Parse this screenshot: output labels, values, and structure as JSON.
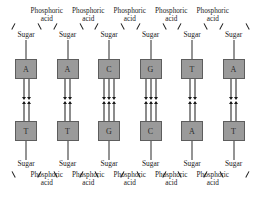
{
  "diagram": {
    "colors": {
      "base_fill": "#9a9a9a",
      "base_border": "#5d5d5d",
      "line": "#1a1a1a",
      "background": "#ffffff"
    },
    "labels": {
      "sugar": "Sugar",
      "phosphoric_line1": "Phosphoric",
      "phosphoric_line2": "acid"
    },
    "top_strand": {
      "bases": [
        "A",
        "A",
        "C",
        "G",
        "T",
        "A"
      ],
      "sugar_labels": [
        "Sugar",
        "Sugar",
        "Sugar",
        "Sugar",
        "Sugar",
        "Sugar"
      ],
      "phosphoric_labels": [
        {
          "line1": "Phosphoric",
          "line2": "acid"
        },
        {
          "line1": "Phosphoric",
          "line2": "acid"
        },
        {
          "line1": "Phosphoric",
          "line2": "acid"
        },
        {
          "line1": "Phosphoric",
          "line2": "acid"
        },
        {
          "line1": "Phosphoric",
          "line2": "acid"
        }
      ]
    },
    "bottom_strand": {
      "bases": [
        "T",
        "T",
        "G",
        "C",
        "A",
        "T"
      ],
      "sugar_labels": [
        "Sugar",
        "Sugar",
        "Sugar",
        "Sugar",
        "Sugar",
        "Sugar"
      ],
      "phosphoric_labels": [
        {
          "line1": "Phosphoric",
          "line2": "acid"
        },
        {
          "line1": "Phosphoric",
          "line2": "acid"
        },
        {
          "line1": "Phosphoric",
          "line2": "acid"
        },
        {
          "line1": "Phosphoric",
          "line2": "acid"
        },
        {
          "line1": "Phosphoric",
          "line2": "acid"
        }
      ]
    },
    "pairs": [
      {
        "top": "A",
        "bottom": "T",
        "bonds": 2
      },
      {
        "top": "A",
        "bottom": "T",
        "bonds": 2
      },
      {
        "top": "C",
        "bottom": "G",
        "bonds": 3
      },
      {
        "top": "G",
        "bottom": "C",
        "bonds": 3
      },
      {
        "top": "T",
        "bottom": "A",
        "bonds": 2
      },
      {
        "top": "A",
        "bottom": "T",
        "bonds": 2
      }
    ],
    "geometry": {
      "columns_x": [
        26,
        67.5,
        109,
        150.5,
        192,
        233.5
      ],
      "top_sugar_y": 31,
      "top_acid_y": 8,
      "top_base_y": 59,
      "bottom_base_y": 121,
      "bottom_sugar_y": 160,
      "bottom_acid_y": 172
    }
  }
}
